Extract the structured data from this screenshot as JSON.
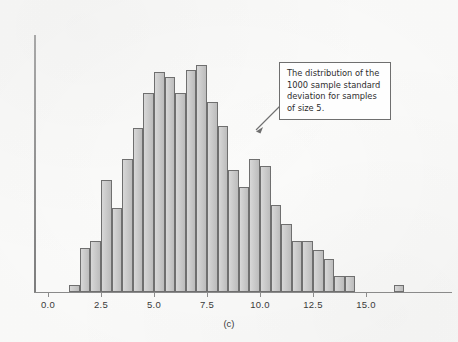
{
  "figure": {
    "caption": "(c)",
    "background_color": "#fdfdfc",
    "bar_fill_color": "#c6c6c6",
    "bar_border_color": "#6f6f6f",
    "axis_color": "#8c8c8c"
  },
  "annotation": {
    "text": "The distribution of the 1000 sample standard deviation for samples of size 5.",
    "border_color": "#6f6f6f",
    "background_color": "#fefefe",
    "arrow_points_to": "histogram right shoulder"
  },
  "chart_data": {
    "type": "bar",
    "title": "",
    "subtitle": "",
    "xlabel": "",
    "ylabel": "",
    "caption": "(c)",
    "bin_width": 0.5,
    "n_samples": 1000,
    "xlim": [
      0.0,
      17.2
    ],
    "ylim": [
      0,
      100
    ],
    "grid": false,
    "legend": null,
    "xticks": [
      0.0,
      2.5,
      5.0,
      7.5,
      10.0,
      12.5,
      15.0
    ],
    "xtick_labels": [
      "0.0",
      "2.5",
      "5.0",
      "7.5",
      "10.0",
      "12.5",
      "15.0"
    ],
    "bin_starts": [
      1.0,
      1.5,
      2.0,
      2.5,
      3.0,
      3.5,
      4.0,
      4.5,
      5.0,
      5.5,
      6.0,
      6.5,
      7.0,
      7.5,
      8.0,
      8.5,
      9.0,
      9.5,
      10.0,
      10.5,
      11.0,
      11.5,
      12.0,
      12.5,
      13.0,
      13.5,
      14.0,
      16.3
    ],
    "categories": [
      "1.0",
      "1.5",
      "2.0",
      "2.5",
      "3.0",
      "3.5",
      "4.0",
      "4.5",
      "5.0",
      "5.5",
      "6.0",
      "6.5",
      "7.0",
      "7.5",
      "8.0",
      "8.5",
      "9.0",
      "9.5",
      "10.0",
      "10.5",
      "11.0",
      "11.5",
      "12.0",
      "12.5",
      "13.0",
      "13.5",
      "14.0",
      "16.3"
    ],
    "values": [
      3,
      19,
      22,
      48,
      36,
      57,
      70,
      85,
      94,
      92,
      85,
      95,
      97,
      81,
      71,
      52,
      45,
      57,
      54,
      37,
      29,
      22,
      22,
      18,
      14,
      7,
      7,
      3
    ]
  }
}
